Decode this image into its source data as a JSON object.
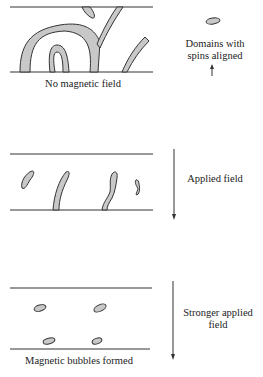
{
  "panels": [
    {
      "id": "no-field",
      "caption": "No magnetic field",
      "side_label_line1": "Domains with",
      "side_label_line2": "spins aligned"
    },
    {
      "id": "applied-field",
      "side_label": "Applied field"
    },
    {
      "id": "stronger-field",
      "caption": "Magnetic bubbles formed",
      "side_label_line1": "Stronger applied",
      "side_label_line2": "field"
    }
  ],
  "colors": {
    "domain_fill": "#c8c8c8",
    "outline": "#333333"
  }
}
